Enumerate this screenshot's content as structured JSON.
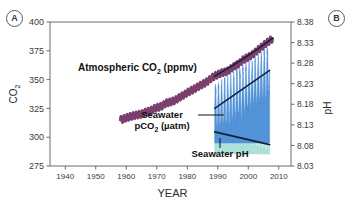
{
  "figure": {
    "panel_a_label": "A",
    "panel_b_label": "B"
  },
  "chart_data": {
    "type": "line",
    "title": "",
    "xlabel": "YEAR",
    "ylabel_left": "CO",
    "ylabel_left_sub": "2",
    "ylabel_right": "pH",
    "xlim": [
      1935,
      2014
    ],
    "ylim_left": [
      275,
      400
    ],
    "ylim_right": [
      8.03,
      8.38
    ],
    "grid": false,
    "legend_position": "inline-annotations",
    "xticks": [
      1940,
      1950,
      1960,
      1970,
      1980,
      1990,
      2000,
      2010
    ],
    "xticklabels": [
      "1940",
      "1950",
      "1960",
      "1970",
      "1980",
      "1990",
      "2000",
      "2010"
    ],
    "yticks_left": [
      275,
      300,
      325,
      350,
      375,
      400
    ],
    "yticklabels_left": [
      "275",
      "300",
      "325",
      "350",
      "375",
      "400"
    ],
    "yticks_right": [
      8.03,
      8.08,
      8.13,
      8.18,
      8.23,
      8.28,
      8.33,
      8.38
    ],
    "yticklabels_right": [
      "8.03",
      "8.08",
      "8.13",
      "8.18",
      "8.23",
      "8.28",
      "8.33",
      "8.38"
    ],
    "annotations": [
      {
        "name": "atmospheric-co2",
        "text": "Atmospheric CO₂ (ppmv)",
        "text_main": "Atmospheric CO",
        "text_sub": "2",
        "text_tail": " (ppmv)",
        "x_px": 78,
        "y_px": 71
      },
      {
        "name": "seawater-pco2",
        "text_line1": "Seawater",
        "text_main2": "pCO",
        "text_sub2": "2",
        "text_tail2": " (µatm)",
        "x_px": 128,
        "y_px": 118
      },
      {
        "name": "seawater-ph",
        "text": "Seawater pH",
        "x_px": 183,
        "y_px": 157
      }
    ],
    "series": [
      {
        "name": "Atmospheric CO2 (ppmv)",
        "axis": "left",
        "color": "#7b3f6e",
        "style": "sawtooth-line",
        "x_start": 1958,
        "x_end": 2008,
        "x": [
          1958,
          1959,
          1960,
          1961,
          1962,
          1963,
          1964,
          1965,
          1966,
          1967,
          1968,
          1969,
          1970,
          1971,
          1972,
          1973,
          1974,
          1975,
          1976,
          1977,
          1978,
          1979,
          1980,
          1981,
          1982,
          1983,
          1984,
          1985,
          1986,
          1987,
          1988,
          1989,
          1990,
          1991,
          1992,
          1993,
          1994,
          1995,
          1996,
          1997,
          1998,
          1999,
          2000,
          2001,
          2002,
          2003,
          2004,
          2005,
          2006,
          2007,
          2008
        ],
        "values": [
          315.0,
          315.8,
          316.9,
          317.6,
          318.4,
          319.0,
          319.6,
          320.0,
          321.4,
          322.2,
          323.0,
          324.6,
          325.7,
          326.3,
          327.5,
          329.7,
          330.2,
          331.1,
          332.0,
          333.8,
          335.4,
          336.8,
          338.7,
          340.1,
          341.4,
          343.0,
          344.6,
          346.0,
          347.4,
          349.2,
          351.6,
          353.1,
          354.4,
          355.6,
          356.4,
          357.1,
          358.8,
          360.8,
          362.6,
          363.8,
          366.6,
          368.3,
          369.5,
          371.0,
          373.1,
          375.6,
          377.4,
          379.8,
          381.8,
          383.7,
          385.6
        ]
      },
      {
        "name": "Seawater pCO2 (µatm)",
        "axis": "left",
        "color": "#4c8fd6",
        "style": "high-frequency-fill",
        "x_start": 1989,
        "x_end": 2007,
        "trend_line": {
          "color": "#14213b",
          "x": [
            1989,
            2007
          ],
          "values": [
            325,
            358
          ]
        },
        "seasonal_amplitude": 20,
        "x": [
          1989,
          1990,
          1991,
          1992,
          1993,
          1994,
          1995,
          1996,
          1997,
          1998,
          1999,
          2000,
          2001,
          2002,
          2003,
          2004,
          2005,
          2006,
          2007
        ],
        "values": [
          325,
          326,
          328,
          329,
          331,
          332,
          334,
          336,
          338,
          339,
          341,
          343,
          345,
          347,
          349,
          351,
          353,
          356,
          358
        ]
      },
      {
        "name": "Seawater pH",
        "axis": "right",
        "color": "#a8ded6",
        "style": "high-frequency-fill",
        "x_start": 1989,
        "x_end": 2007,
        "trend_line": {
          "color": "#14213b",
          "x": [
            1989,
            2007
          ],
          "values": [
            8.113,
            8.082
          ]
        },
        "seasonal_amplitude": 0.012,
        "x": [
          1989,
          1990,
          1991,
          1992,
          1993,
          1994,
          1995,
          1996,
          1997,
          1998,
          1999,
          2000,
          2001,
          2002,
          2003,
          2004,
          2005,
          2006,
          2007
        ],
        "values": [
          8.113,
          8.111,
          8.109,
          8.107,
          8.105,
          8.103,
          8.101,
          8.099,
          8.097,
          8.095,
          8.094,
          8.092,
          8.09,
          8.089,
          8.087,
          8.086,
          8.084,
          8.083,
          8.082
        ]
      }
    ]
  }
}
